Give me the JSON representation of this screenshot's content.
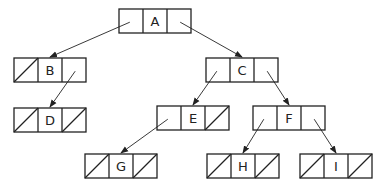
{
  "diagram": {
    "type": "binary-tree-linked-representation",
    "stroke_color": "#222222",
    "background": "#ffffff",
    "nodes": [
      {
        "id": "A",
        "label": "A",
        "x": 119,
        "y": 9,
        "left_null": false,
        "right_null": false
      },
      {
        "id": "B",
        "label": "B",
        "x": 14,
        "y": 58,
        "left_null": true,
        "right_null": false
      },
      {
        "id": "C",
        "label": "C",
        "x": 206,
        "y": 58,
        "left_null": false,
        "right_null": false
      },
      {
        "id": "D",
        "label": "D",
        "x": 14,
        "y": 108,
        "left_null": true,
        "right_null": true
      },
      {
        "id": "E",
        "label": "E",
        "x": 157,
        "y": 106,
        "left_null": false,
        "right_null": true
      },
      {
        "id": "F",
        "label": "F",
        "x": 253,
        "y": 106,
        "left_null": false,
        "right_null": false
      },
      {
        "id": "G",
        "label": "G",
        "x": 85,
        "y": 154,
        "left_null": true,
        "right_null": true
      },
      {
        "id": "H",
        "label": "H",
        "x": 207,
        "y": 154,
        "left_null": true,
        "right_null": true
      },
      {
        "id": "I",
        "label": "I",
        "x": 300,
        "y": 154,
        "left_null": true,
        "right_null": true
      }
    ],
    "edges": [
      {
        "from": "A",
        "side": "left",
        "to": "B"
      },
      {
        "from": "A",
        "side": "right",
        "to": "C"
      },
      {
        "from": "B",
        "side": "right",
        "to": "D"
      },
      {
        "from": "C",
        "side": "left",
        "to": "E"
      },
      {
        "from": "C",
        "side": "right",
        "to": "F"
      },
      {
        "from": "E",
        "side": "left",
        "to": "G"
      },
      {
        "from": "F",
        "side": "left",
        "to": "H"
      },
      {
        "from": "F",
        "side": "right",
        "to": "I"
      }
    ],
    "node_size": {
      "cell_width": 24,
      "height": 24
    }
  }
}
